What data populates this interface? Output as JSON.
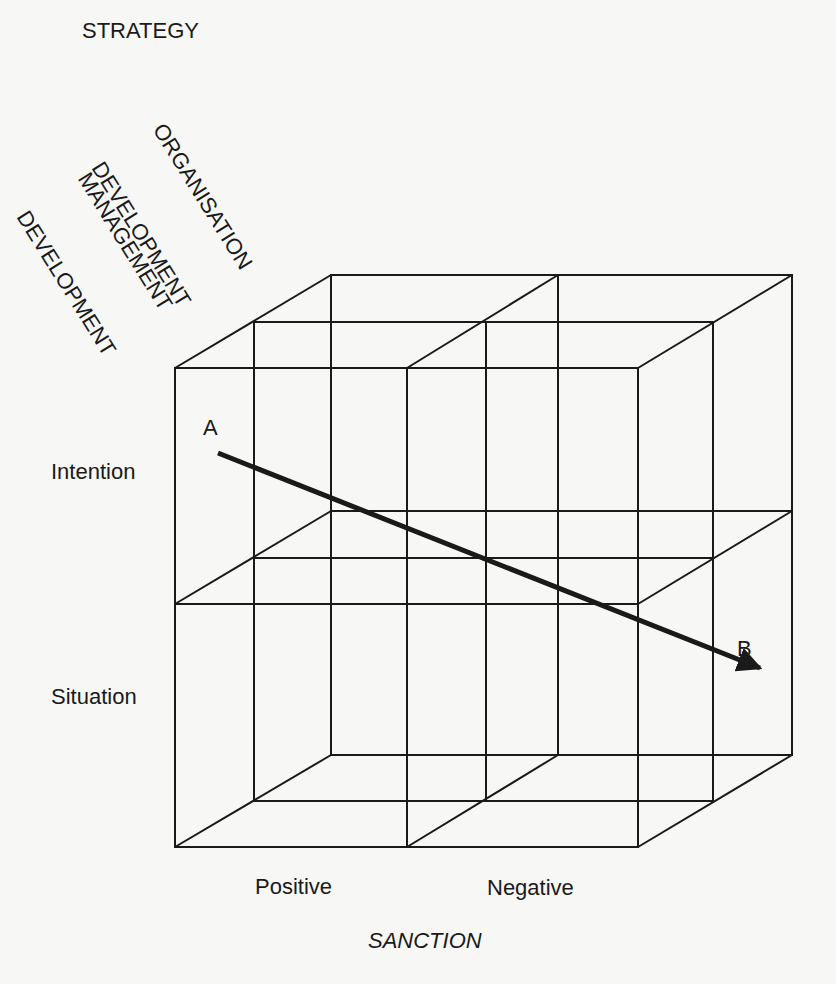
{
  "diagram": {
    "title": "STRATEGY",
    "depth_axis_labels": [
      {
        "line1": "ORGANISATION",
        "line2": "DEVELOPMENT"
      },
      {
        "line1": "MANAGEMENT",
        "line2": "DEVELOPMENT"
      }
    ],
    "row_labels": [
      "Intention",
      "Situation"
    ],
    "column_labels": [
      "Positive",
      "Negative"
    ],
    "x_axis_title": "SANCTION",
    "arrow": {
      "start_label": "A",
      "end_label": "B"
    },
    "colors": {
      "line": "#1a1a1a",
      "background": "#f7f7f6"
    }
  }
}
